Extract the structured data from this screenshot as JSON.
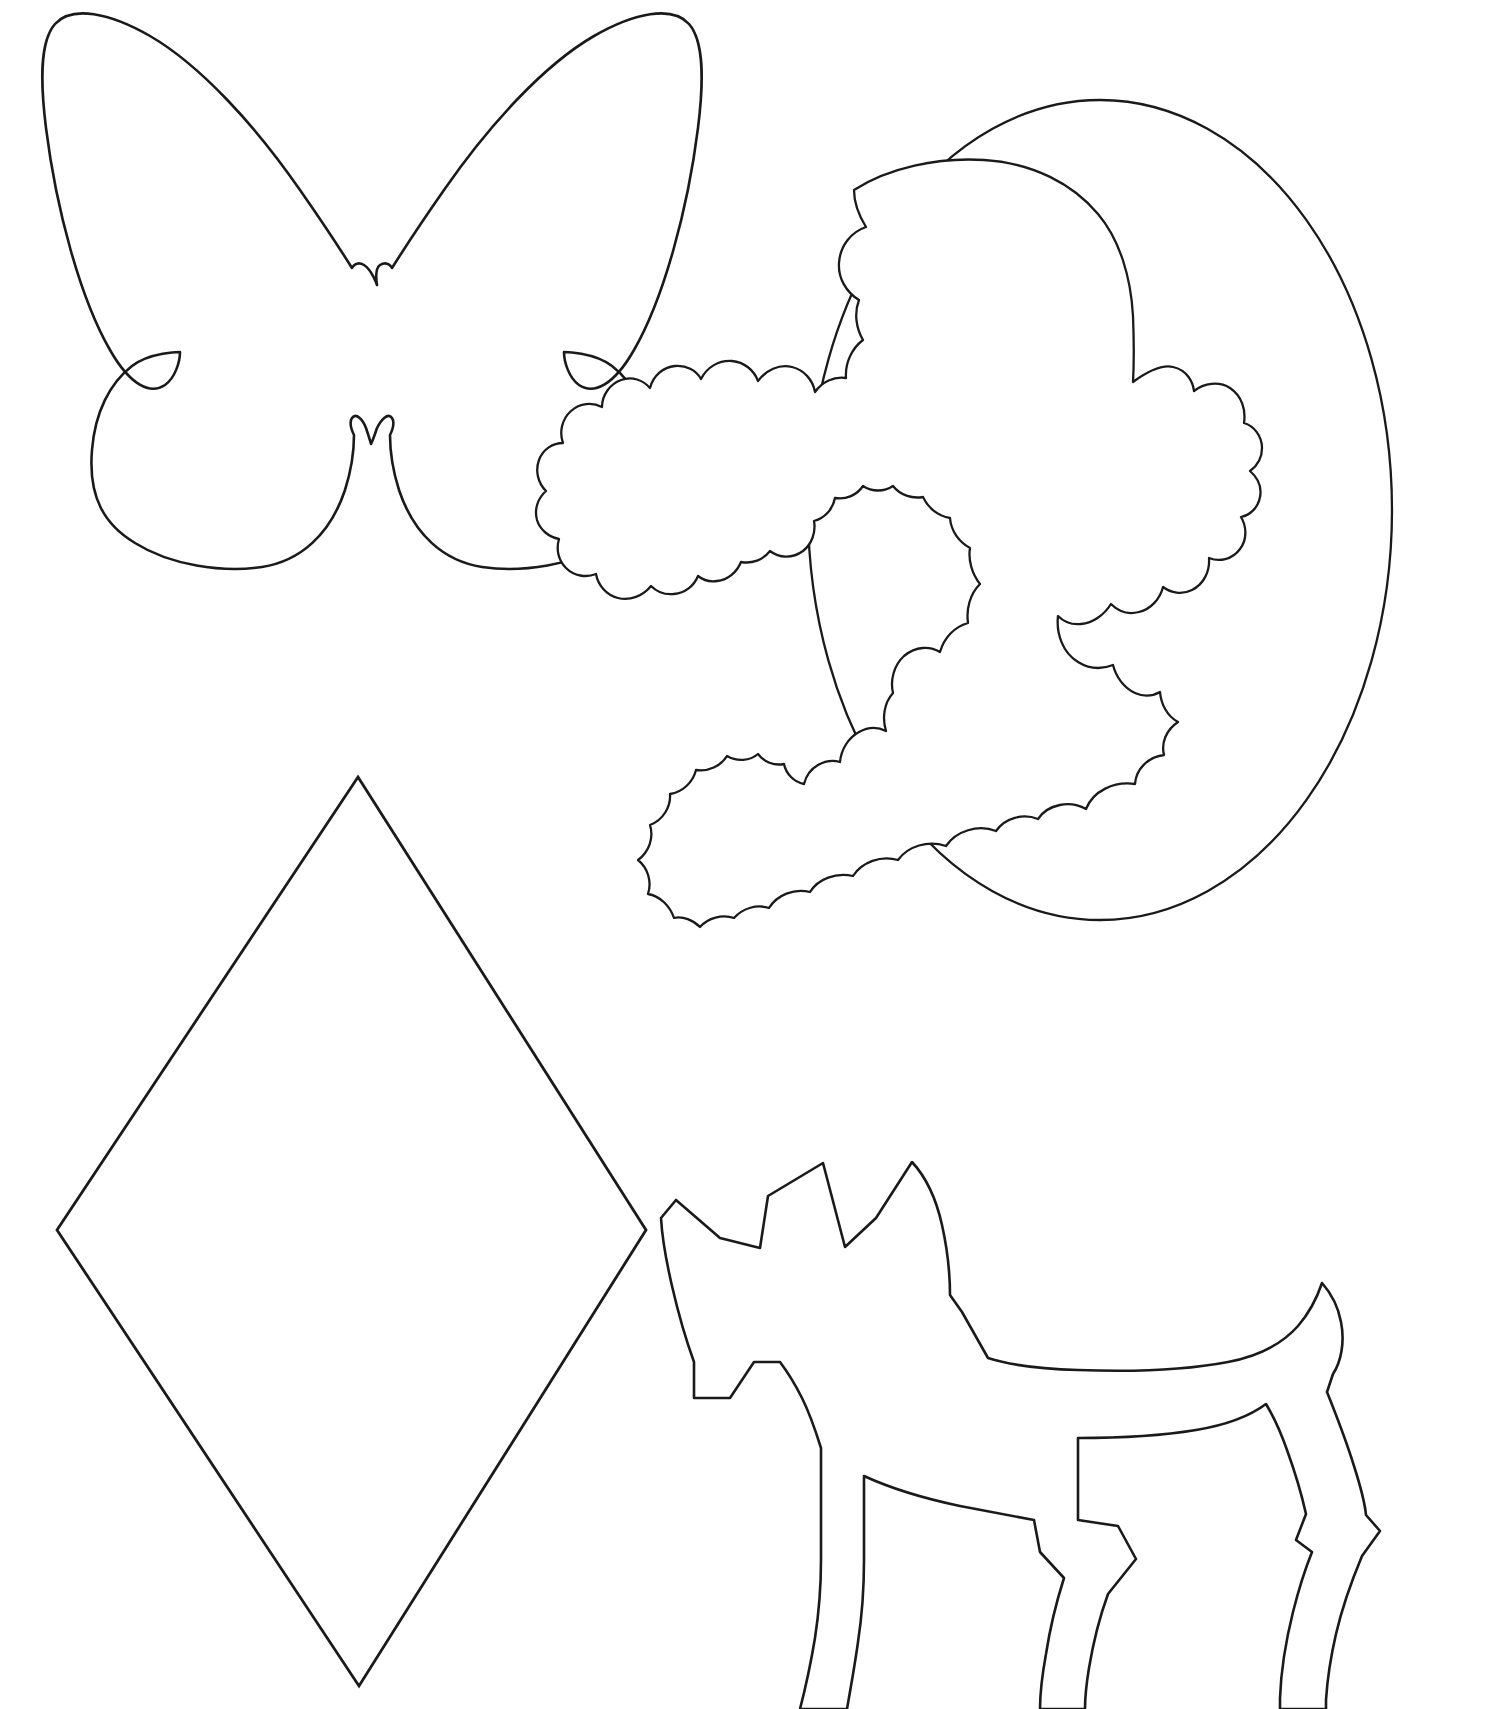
{
  "page": {
    "background_color": "#ffffff",
    "stroke_color": "#1a1a1a",
    "width_px": 1504,
    "height_px": 1709
  },
  "shapes": [
    {
      "id": "butterfly",
      "name": "butterfly-outline",
      "label": "Butterfly",
      "position": "top-left",
      "bounds": {
        "x": 40,
        "y": 10,
        "width": 700,
        "height": 580
      },
      "stroke_color": "#1a1a1a",
      "fill_color": "#ffffff"
    },
    {
      "id": "cameo",
      "name": "cameo-silhouette-outline",
      "label": "Cameo Lady Silhouette in Oval",
      "position": "top-right",
      "bounds": {
        "x": 806,
        "y": 100,
        "width": 590,
        "height": 820
      },
      "stroke_color": "#1a1a1a",
      "fill_color": "#ffffff"
    },
    {
      "id": "diamond",
      "name": "diamond-outline",
      "label": "Diamond / Rhombus",
      "position": "bottom-left",
      "bounds": {
        "x": 57,
        "y": 777,
        "width": 589,
        "height": 909
      },
      "vertices": {
        "top": [
          358,
          777
        ],
        "left": [
          57,
          1230
        ],
        "bottom": [
          359,
          1686
        ],
        "right": [
          646,
          1230
        ]
      },
      "stroke_color": "#1a1a1a",
      "fill_color": "#ffffff"
    },
    {
      "id": "scottie-dog",
      "name": "scottie-dog-outline",
      "label": "Scottie Dog",
      "position": "bottom-right",
      "bounds": {
        "x": 660,
        "y": 1155,
        "width": 640,
        "height": 554
      },
      "stroke_color": "#1a1a1a",
      "fill_color": "#ffffff"
    }
  ]
}
